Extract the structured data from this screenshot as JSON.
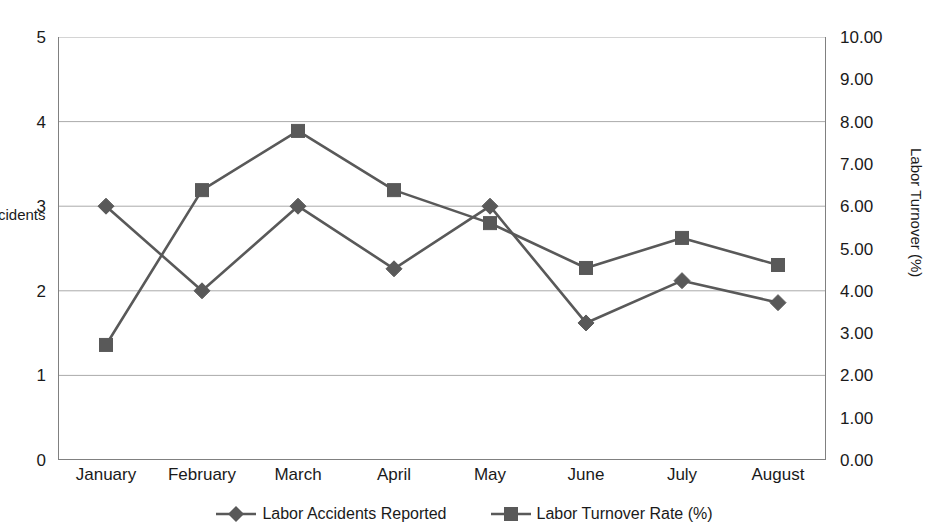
{
  "chart_data": {
    "type": "line",
    "title": "",
    "xlabel": "",
    "categories": [
      "January",
      "February",
      "March",
      "April",
      "May",
      "June",
      "July",
      "August"
    ],
    "series": [
      {
        "name": "Labor Accidents Reported",
        "axis": "left",
        "marker": "diamond",
        "color": "#595959",
        "values": [
          3.0,
          2.0,
          3.0,
          2.26,
          3.0,
          1.62,
          2.12,
          1.86
        ]
      },
      {
        "name": "Labor Turnover Rate (%)",
        "axis": "right",
        "marker": "square",
        "color": "#595959",
        "values": [
          2.72,
          6.38,
          7.78,
          6.38,
          5.6,
          4.54,
          5.25,
          4.61
        ]
      }
    ],
    "y_left": {
      "label": "Accidents",
      "ylim": [
        0,
        5
      ],
      "ticks": [
        "0",
        "1",
        "2",
        "3",
        "4",
        "5"
      ],
      "tick_values": [
        0,
        1,
        2,
        3,
        4,
        5
      ]
    },
    "y_right": {
      "label": "Labor Turnover (%)",
      "ylim": [
        0,
        10
      ],
      "ticks": [
        "0.00",
        "1.00",
        "2.00",
        "3.00",
        "4.00",
        "5.00",
        "6.00",
        "7.00",
        "8.00",
        "9.00",
        "10.00"
      ],
      "tick_values": [
        0,
        1,
        2,
        3,
        4,
        5,
        6,
        7,
        8,
        9,
        10
      ]
    },
    "grid": {
      "horizontal": true,
      "vertical": false,
      "color": "#aaaaaa"
    },
    "legend": {
      "position": "bottom",
      "entries": [
        {
          "label": "Labor Accidents Reported",
          "marker": "diamond",
          "color": "#595959"
        },
        {
          "label": "Labor Turnover Rate (%)",
          "marker": "square",
          "color": "#595959"
        }
      ]
    },
    "style": {
      "background": "#ffffff",
      "axis_color": "#808080",
      "line_color": "#595959",
      "text_color": "#1a1a1a"
    }
  }
}
